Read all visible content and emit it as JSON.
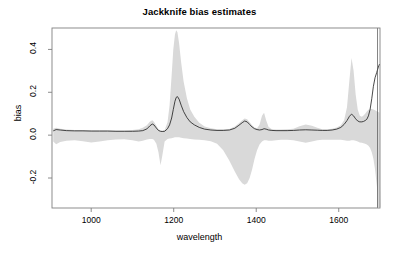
{
  "chart_data": {
    "type": "area",
    "title": "Jackknife bias estimates",
    "xlabel": "wavelength",
    "ylabel": "bias",
    "xlim": [
      905,
      1700
    ],
    "ylim": [
      -0.34,
      0.5
    ],
    "xticks": [
      1000,
      1200,
      1400,
      1600
    ],
    "xtick_labels": [
      "1000",
      "1200",
      "1400",
      "1600"
    ],
    "yticks": [
      -0.2,
      0.0,
      0.2,
      0.4
    ],
    "ytick_labels": [
      "-0.2",
      "0.0",
      "0.2",
      "0.4"
    ],
    "grid": false,
    "legend": "none",
    "band_color": "#d9d9d9",
    "line_color": "#1a1a1a",
    "box_color": "#808080",
    "series": [
      {
        "name": "jackknife bias",
        "type": "line",
        "x": [
          908,
          915,
          925,
          940,
          960,
          980,
          1000,
          1020,
          1040,
          1060,
          1080,
          1100,
          1115,
          1125,
          1135,
          1142,
          1148,
          1152,
          1158,
          1163,
          1168,
          1172,
          1178,
          1185,
          1190,
          1195,
          1199,
          1203,
          1206,
          1209,
          1213,
          1218,
          1224,
          1232,
          1240,
          1250,
          1262,
          1275,
          1290,
          1305,
          1320,
          1335,
          1348,
          1358,
          1366,
          1372,
          1378,
          1384,
          1390,
          1396,
          1402,
          1408,
          1414,
          1419,
          1424,
          1430,
          1438,
          1448,
          1460,
          1475,
          1490,
          1505,
          1520,
          1535,
          1548,
          1560,
          1572,
          1584,
          1595,
          1605,
          1613,
          1620,
          1626,
          1631,
          1636,
          1641,
          1646,
          1651,
          1656,
          1660,
          1664,
          1668,
          1672,
          1676,
          1680,
          1684,
          1688,
          1692,
          1696,
          1699
        ],
        "y": [
          0.02,
          0.026,
          0.024,
          0.021,
          0.02,
          0.02,
          0.019,
          0.019,
          0.019,
          0.018,
          0.018,
          0.018,
          0.019,
          0.021,
          0.029,
          0.043,
          0.052,
          0.048,
          0.033,
          0.022,
          0.018,
          0.017,
          0.018,
          0.03,
          0.048,
          0.08,
          0.12,
          0.158,
          0.176,
          0.18,
          0.168,
          0.14,
          0.11,
          0.082,
          0.062,
          0.048,
          0.036,
          0.028,
          0.024,
          0.022,
          0.022,
          0.024,
          0.032,
          0.046,
          0.058,
          0.066,
          0.062,
          0.05,
          0.038,
          0.03,
          0.026,
          0.024,
          0.026,
          0.03,
          0.028,
          0.024,
          0.022,
          0.021,
          0.021,
          0.021,
          0.022,
          0.024,
          0.025,
          0.024,
          0.023,
          0.022,
          0.022,
          0.024,
          0.028,
          0.036,
          0.05,
          0.068,
          0.088,
          0.098,
          0.09,
          0.076,
          0.066,
          0.062,
          0.062,
          0.064,
          0.068,
          0.074,
          0.09,
          0.12,
          0.17,
          0.228,
          0.268,
          0.292,
          0.318,
          0.332
        ]
      },
      {
        "name": "jackknife band upper",
        "type": "band-upper",
        "x": [
          908,
          915,
          925,
          940,
          960,
          980,
          1000,
          1020,
          1040,
          1060,
          1080,
          1100,
          1115,
          1125,
          1135,
          1142,
          1148,
          1152,
          1158,
          1163,
          1168,
          1172,
          1178,
          1185,
          1190,
          1195,
          1199,
          1203,
          1206,
          1209,
          1213,
          1218,
          1224,
          1232,
          1240,
          1250,
          1262,
          1275,
          1290,
          1305,
          1320,
          1335,
          1348,
          1358,
          1366,
          1372,
          1378,
          1384,
          1390,
          1396,
          1402,
          1408,
          1414,
          1419,
          1424,
          1430,
          1438,
          1448,
          1460,
          1475,
          1490,
          1505,
          1520,
          1535,
          1548,
          1560,
          1572,
          1584,
          1595,
          1605,
          1613,
          1620,
          1626,
          1631,
          1636,
          1641,
          1646,
          1651,
          1656,
          1660,
          1664,
          1668,
          1672,
          1676,
          1680,
          1684,
          1688,
          1692,
          1696,
          1699
        ],
        "y": [
          0.03,
          0.034,
          0.03,
          0.026,
          0.024,
          0.024,
          0.023,
          0.023,
          0.023,
          0.022,
          0.022,
          0.024,
          0.028,
          0.034,
          0.046,
          0.062,
          0.07,
          0.062,
          0.044,
          0.028,
          0.022,
          0.021,
          0.024,
          0.06,
          0.14,
          0.28,
          0.4,
          0.47,
          0.49,
          0.48,
          0.43,
          0.34,
          0.25,
          0.172,
          0.12,
          0.086,
          0.058,
          0.04,
          0.032,
          0.028,
          0.027,
          0.029,
          0.04,
          0.056,
          0.07,
          0.078,
          0.074,
          0.06,
          0.046,
          0.036,
          0.032,
          0.048,
          0.09,
          0.104,
          0.07,
          0.038,
          0.028,
          0.026,
          0.026,
          0.027,
          0.03,
          0.042,
          0.05,
          0.044,
          0.034,
          0.028,
          0.027,
          0.03,
          0.036,
          0.046,
          0.07,
          0.13,
          0.26,
          0.36,
          0.3,
          0.19,
          0.12,
          0.09,
          0.086,
          0.092,
          0.1,
          0.11,
          0.118,
          0.122,
          0.122,
          0.12,
          0.116,
          0.112,
          0.108,
          0.105
        ]
      },
      {
        "name": "jackknife band lower",
        "type": "band-lower",
        "x": [
          908,
          915,
          925,
          940,
          960,
          980,
          1000,
          1020,
          1040,
          1060,
          1080,
          1100,
          1115,
          1125,
          1135,
          1142,
          1148,
          1152,
          1158,
          1163,
          1168,
          1172,
          1178,
          1185,
          1190,
          1195,
          1199,
          1203,
          1206,
          1209,
          1213,
          1218,
          1224,
          1232,
          1240,
          1250,
          1262,
          1275,
          1290,
          1305,
          1320,
          1335,
          1348,
          1358,
          1366,
          1372,
          1378,
          1384,
          1390,
          1396,
          1402,
          1408,
          1414,
          1419,
          1424,
          1430,
          1438,
          1448,
          1460,
          1475,
          1490,
          1505,
          1520,
          1535,
          1548,
          1560,
          1572,
          1584,
          1595,
          1605,
          1613,
          1620,
          1626,
          1631,
          1636,
          1641,
          1646,
          1651,
          1656,
          1660,
          1664,
          1668,
          1672,
          1676,
          1680,
          1684,
          1688,
          1692,
          1696,
          1699
        ],
        "y": [
          -0.03,
          -0.042,
          -0.032,
          -0.026,
          -0.024,
          -0.028,
          -0.034,
          -0.03,
          -0.024,
          -0.02,
          -0.019,
          -0.024,
          -0.03,
          -0.026,
          -0.02,
          -0.018,
          -0.018,
          -0.022,
          -0.04,
          -0.08,
          -0.14,
          -0.1,
          -0.03,
          -0.018,
          -0.016,
          -0.014,
          -0.012,
          -0.01,
          -0.01,
          -0.01,
          -0.01,
          -0.012,
          -0.014,
          -0.016,
          -0.018,
          -0.02,
          -0.022,
          -0.024,
          -0.028,
          -0.04,
          -0.07,
          -0.12,
          -0.17,
          -0.205,
          -0.225,
          -0.232,
          -0.225,
          -0.2,
          -0.16,
          -0.11,
          -0.07,
          -0.044,
          -0.03,
          -0.024,
          -0.024,
          -0.026,
          -0.026,
          -0.024,
          -0.022,
          -0.022,
          -0.024,
          -0.03,
          -0.036,
          -0.03,
          -0.024,
          -0.022,
          -0.022,
          -0.022,
          -0.022,
          -0.022,
          -0.024,
          -0.026,
          -0.026,
          -0.024,
          -0.024,
          -0.026,
          -0.03,
          -0.034,
          -0.036,
          -0.038,
          -0.04,
          -0.044,
          -0.05,
          -0.06,
          -0.08,
          -0.11,
          -0.16,
          -0.23,
          -0.3,
          -0.335
        ]
      }
    ]
  }
}
